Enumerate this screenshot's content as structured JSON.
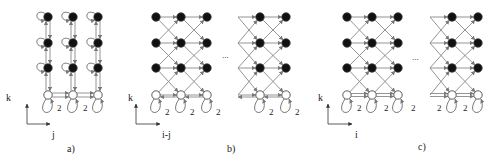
{
  "panels": [
    {
      "id": "a",
      "caption": "a)",
      "caption_pos": [
        67,
        152
      ],
      "axis": {
        "origin": [
          27,
          124
        ],
        "x_end": [
          50,
          124
        ],
        "y_end": [
          27,
          104
        ],
        "y_label": "k",
        "y_label_pos": [
          6,
          101
        ],
        "x_label": "j",
        "x_label_pos": [
          52,
          138
        ]
      },
      "columns": [
        48,
        73,
        98
      ],
      "filled_rows": [
        17,
        43,
        68
      ],
      "open_row": 95,
      "edge_labels": [
        {
          "text": "2",
          "pos": [
            57,
            111
          ]
        },
        {
          "text": "2",
          "pos": [
            83,
            111
          ]
        }
      ]
    },
    {
      "id": "b",
      "caption": "b)",
      "caption_pos": [
        227,
        152
      ],
      "axis": {
        "origin": [
          136,
          124
        ],
        "x_end": [
          160,
          124
        ],
        "y_end": [
          136,
          104
        ],
        "y_label": "k",
        "y_label_pos": [
          128,
          101
        ],
        "x_label": "i-j",
        "x_label_pos": [
          162,
          138
        ]
      },
      "groups": [
        {
          "columns": [
            156,
            181,
            207
          ],
          "left_stub": false
        },
        {
          "columns": [
            260,
            286
          ],
          "left_stub": true,
          "stub_x": 238
        }
      ],
      "filled_rows": [
        17,
        43,
        68
      ],
      "open_row": 95,
      "ellipsis": {
        "text": "...",
        "pos": [
          222,
          58
        ]
      },
      "edge_labels_per_node": "2"
    },
    {
      "id": "c",
      "caption": "c)",
      "caption_pos": [
        418,
        150
      ],
      "axis": {
        "origin": [
          328,
          124
        ],
        "x_end": [
          352,
          124
        ],
        "y_end": [
          328,
          104
        ],
        "y_label": "k",
        "y_label_pos": [
          318,
          101
        ],
        "x_label": "i",
        "x_label_pos": [
          355,
          138
        ]
      },
      "groups": [
        {
          "columns": [
            347,
            372,
            398
          ],
          "left_stub": false
        },
        {
          "columns": [
            452,
            478
          ],
          "left_stub": true,
          "stub_x": 430
        }
      ],
      "filled_rows": [
        17,
        43,
        68
      ],
      "open_row": 95,
      "ellipsis": {
        "text": "...",
        "pos": [
          412,
          60
        ]
      },
      "edge_labels": [
        {
          "text": "2",
          "pos": [
            357,
            111
          ]
        },
        {
          "text": "2",
          "pos": [
            384,
            111
          ]
        },
        {
          "text": "2",
          "pos": [
            411,
            111
          ]
        },
        {
          "text": "2",
          "pos": [
            437,
            111
          ]
        },
        {
          "text": "2",
          "pos": [
            463,
            111
          ]
        }
      ]
    }
  ],
  "colors": {
    "edge": "#888888",
    "node_fill": "#111111",
    "node_open": "#ffffff",
    "node_stroke": "#333333",
    "text": "#222222"
  }
}
